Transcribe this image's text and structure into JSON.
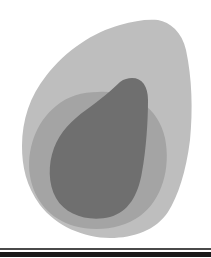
{
  "figure": {
    "regions": [
      {
        "name": "outer-region",
        "color": "#bebebe"
      },
      {
        "name": "middle-region",
        "color": "#a4a4a4"
      },
      {
        "name": "inner-region",
        "color": "#6f6f6f"
      }
    ],
    "rules": [
      {
        "name": "thin-rule",
        "color": "#4a4a4a"
      },
      {
        "name": "thick-rule",
        "color": "#1a1a1a"
      }
    ]
  }
}
